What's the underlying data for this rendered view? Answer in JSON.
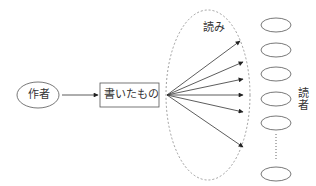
{
  "diagram": {
    "author": {
      "label": "作者"
    },
    "writing": {
      "label": "書いたもの"
    },
    "reading": {
      "label": "読み"
    },
    "readers": {
      "label_line1": "読",
      "label_line2": "者",
      "count_visible": 6
    },
    "colors": {
      "stroke": "#333333",
      "dashed": "#888888",
      "text": "#333333"
    }
  }
}
